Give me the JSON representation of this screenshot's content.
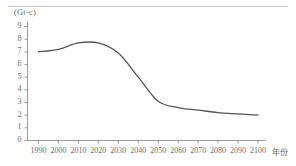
{
  "chart_data": {
    "type": "line",
    "title": "",
    "subtitle": "",
    "xlabel": "年份",
    "ylabel": "(Gt-c)",
    "y_unit": "(Gt-c)",
    "xlim": [
      1985,
      2105
    ],
    "ylim": [
      0,
      9
    ],
    "grid": false,
    "legend": null,
    "x_ticks": [
      "1990",
      "2000",
      "2010",
      "2020",
      "2030",
      "2040",
      "2050",
      "2060",
      "2070",
      "2080",
      "2090",
      "2100"
    ],
    "y_ticks": [
      "0",
      "1",
      "2",
      "3",
      "4",
      "5",
      "6",
      "7",
      "8",
      "9"
    ],
    "x": [
      1990,
      2000,
      2010,
      2020,
      2030,
      2040,
      2050,
      2060,
      2070,
      2080,
      2090,
      2100
    ],
    "series": [
      {
        "name": "CO2 emissions",
        "color": "#555555",
        "values": [
          7.0,
          7.2,
          7.7,
          7.7,
          6.9,
          5.0,
          3.1,
          2.6,
          2.4,
          2.2,
          2.1,
          2.0
        ]
      }
    ]
  },
  "axis": {
    "line_color": "#9a9a9a",
    "tick_color": "#9a9a9a"
  }
}
